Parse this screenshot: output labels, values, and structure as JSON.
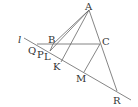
{
  "diagram": {
    "labels": {
      "A": "A",
      "B": "B",
      "C": "C",
      "l": "l",
      "Q": "Q",
      "P": "P",
      "L": "L",
      "K": "K",
      "M": "M",
      "R": "R"
    },
    "stroke_color": "#666666",
    "text_color": "#333333"
  }
}
